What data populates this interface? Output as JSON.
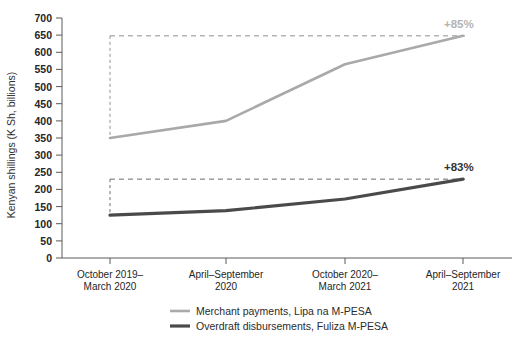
{
  "chart_data": {
    "type": "line",
    "title": "",
    "xlabel": "",
    "ylabel": "Kenyan shillings (K Sh, billions)",
    "ylim": [
      0,
      700
    ],
    "ytick_step": 50,
    "yticks": [
      "0",
      "50",
      "100",
      "150",
      "200",
      "250",
      "300",
      "350",
      "400",
      "450",
      "500",
      "550",
      "600",
      "650",
      "700"
    ],
    "grid": false,
    "legend_position": "bottom",
    "categories": [
      "October 2019–\nMarch 2020",
      "April–September\n2020",
      "October 2020–\nMarch 2021",
      "April–September\n2021"
    ],
    "categories_lines": [
      [
        "October 2019–",
        "March 2020"
      ],
      [
        "April–September",
        "2020"
      ],
      [
        "October 2020–",
        "March 2021"
      ],
      [
        "April–September",
        "2021"
      ]
    ],
    "series": [
      {
        "name": "Merchant payments, Lipa na M-PESA",
        "color": "#a9a9a9",
        "values": [
          350,
          400,
          565,
          648
        ],
        "growth_label": "+85%",
        "reference_value": 648
      },
      {
        "name": "Overdraft disbursements, Fuliza M-PESA",
        "color": "#4a4a4a",
        "values": [
          125,
          138,
          172,
          230
        ],
        "growth_label": "+83%",
        "reference_value": 230
      }
    ],
    "annotations": [
      {
        "text": "+85%",
        "value": 648,
        "color": "#b4b4b4"
      },
      {
        "text": "+83%",
        "value": 230,
        "color": "#333333"
      }
    ]
  },
  "legend": {
    "items": [
      {
        "label": "Merchant payments, Lipa na M-PESA",
        "color": "#a9a9a9",
        "thickness": 2.6
      },
      {
        "label": "Overdraft disbursements, Fuliza M-PESA",
        "color": "#4a4a4a",
        "thickness": 3.2
      }
    ]
  },
  "axis": {
    "y_title": "Kenyan shillings (K Sh, billions)"
  }
}
